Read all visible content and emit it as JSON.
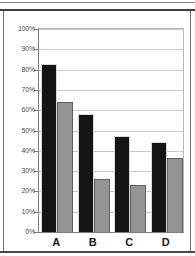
{
  "chart_data": {
    "type": "bar",
    "title": "",
    "subtitle": "",
    "xlabel": "",
    "ylabel": "",
    "categories": [
      "A",
      "B",
      "C",
      "D"
    ],
    "series": [
      {
        "name": "series-1",
        "color": "#141414",
        "values": [
          83,
          58,
          47.5,
          44.5
        ]
      },
      {
        "name": "series-2",
        "color": "#949494",
        "values": [
          64,
          26,
          23,
          36.5
        ]
      }
    ],
    "ylim": [
      0,
      100
    ],
    "ytick_values": [
      0,
      10,
      20,
      30,
      40,
      50,
      60,
      70,
      80,
      90,
      100
    ],
    "ytick_labels": [
      "0%",
      "10%",
      "20%",
      "30%",
      "40%",
      "50%",
      "60%",
      "70%",
      "80%",
      "90%",
      "100%"
    ],
    "grid": true,
    "legend": false,
    "legend_position": "none",
    "annotations": []
  }
}
